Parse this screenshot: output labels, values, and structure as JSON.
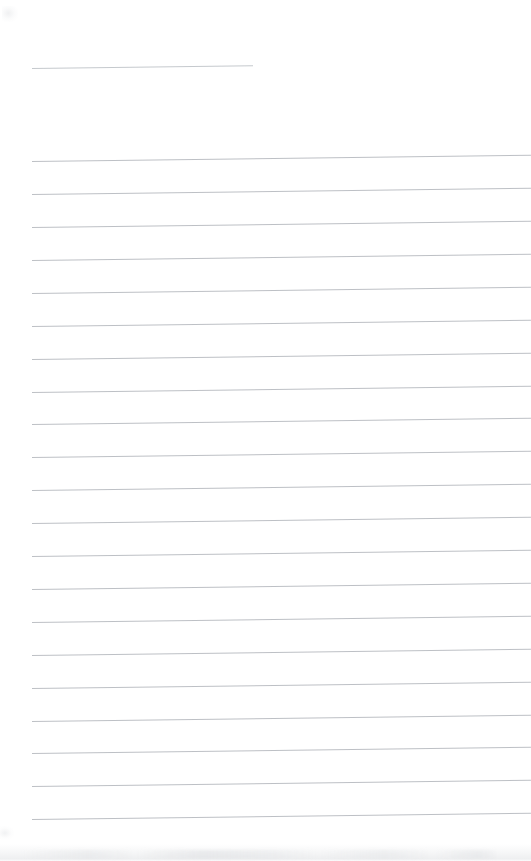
{
  "document": {
    "type": "scanned-blank-ruled-page",
    "title": "",
    "visible_text": "",
    "background_color": "#ffffff",
    "rule_color": "#b9bdc2",
    "page_width": 531,
    "page_height": 861
  },
  "rules": {
    "left_margin_x": 32,
    "line_spacing": 33,
    "skew_degrees": -0.72,
    "thickness": 1,
    "header_rule": {
      "name": "header-rule",
      "x": 32,
      "y": 68,
      "width": 221,
      "bleeds_right": false
    },
    "body_rules": [
      {
        "name": "rule-1",
        "x": 32,
        "y": 161,
        "width": 499,
        "bleeds_right": true
      },
      {
        "name": "rule-2",
        "x": 32,
        "y": 194,
        "width": 499,
        "bleeds_right": true
      },
      {
        "name": "rule-3",
        "x": 32,
        "y": 227,
        "width": 499,
        "bleeds_right": true
      },
      {
        "name": "rule-4",
        "x": 32,
        "y": 260,
        "width": 499,
        "bleeds_right": true
      },
      {
        "name": "rule-5",
        "x": 32,
        "y": 293,
        "width": 499,
        "bleeds_right": true
      },
      {
        "name": "rule-6",
        "x": 32,
        "y": 326,
        "width": 499,
        "bleeds_right": true
      },
      {
        "name": "rule-7",
        "x": 32,
        "y": 359,
        "width": 499,
        "bleeds_right": true
      },
      {
        "name": "rule-8",
        "x": 32,
        "y": 392,
        "width": 499,
        "bleeds_right": true
      },
      {
        "name": "rule-9",
        "x": 32,
        "y": 424,
        "width": 499,
        "bleeds_right": true
      },
      {
        "name": "rule-10",
        "x": 32,
        "y": 457,
        "width": 499,
        "bleeds_right": true
      },
      {
        "name": "rule-11",
        "x": 32,
        "y": 490,
        "width": 499,
        "bleeds_right": true
      },
      {
        "name": "rule-12",
        "x": 32,
        "y": 523,
        "width": 499,
        "bleeds_right": true
      },
      {
        "name": "rule-13",
        "x": 32,
        "y": 556,
        "width": 499,
        "bleeds_right": true
      },
      {
        "name": "rule-14",
        "x": 32,
        "y": 589,
        "width": 499,
        "bleeds_right": true
      },
      {
        "name": "rule-15",
        "x": 32,
        "y": 622,
        "width": 499,
        "bleeds_right": true
      },
      {
        "name": "rule-16",
        "x": 32,
        "y": 655,
        "width": 499,
        "bleeds_right": true
      },
      {
        "name": "rule-17",
        "x": 32,
        "y": 688,
        "width": 499,
        "bleeds_right": true
      },
      {
        "name": "rule-18",
        "x": 32,
        "y": 721,
        "width": 499,
        "bleeds_right": true
      },
      {
        "name": "rule-19",
        "x": 32,
        "y": 753,
        "width": 499,
        "bleeds_right": true
      },
      {
        "name": "rule-20",
        "x": 32,
        "y": 786,
        "width": 499,
        "bleeds_right": true
      },
      {
        "name": "rule-21",
        "x": 32,
        "y": 819,
        "width": 499,
        "bleeds_right": true
      }
    ]
  },
  "artifacts": {
    "bottom_smudge": {
      "name": "scan-smudge-bottom"
    },
    "topleft_smudge": {
      "name": "scan-smudge-topleft"
    },
    "leftedge_smudge": {
      "name": "scan-smudge-leftedge"
    }
  }
}
